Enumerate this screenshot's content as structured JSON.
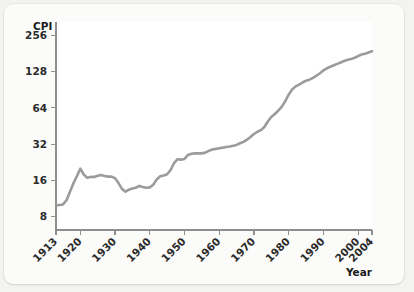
{
  "chart_data": {
    "type": "line",
    "title": "",
    "xlabel": "Year",
    "ylabel": "CPI",
    "yscale": "log2",
    "ylim": [
      6.2,
      330
    ],
    "xlim": [
      1913,
      2004
    ],
    "grid": false,
    "legend": null,
    "line_color": "#9b9b9b",
    "axis_color": "#8e8e8e",
    "plot_background": "#ffffff",
    "card_background": "#fbfbfa",
    "page_background": "#f3f3f1",
    "ytick_labels": [
      "256",
      "128",
      "64",
      "32",
      "16",
      "8"
    ],
    "ytick_values": [
      256,
      128,
      64,
      32,
      16,
      8
    ],
    "xtick_labels": [
      "1913",
      "1920",
      "1930",
      "1940",
      "1950",
      "1960",
      "1970",
      "1980",
      "1990",
      "2000",
      "2004"
    ],
    "xtick_values": [
      1913,
      1920,
      1930,
      1940,
      1950,
      1960,
      1970,
      1980,
      1990,
      2000,
      2004
    ],
    "x": [
      1913,
      1914,
      1915,
      1916,
      1917,
      1918,
      1919,
      1920,
      1921,
      1922,
      1923,
      1924,
      1925,
      1926,
      1927,
      1928,
      1929,
      1930,
      1931,
      1932,
      1933,
      1934,
      1935,
      1936,
      1937,
      1938,
      1939,
      1940,
      1941,
      1942,
      1943,
      1944,
      1945,
      1946,
      1947,
      1948,
      1949,
      1950,
      1951,
      1952,
      1953,
      1954,
      1955,
      1956,
      1957,
      1958,
      1959,
      1960,
      1961,
      1962,
      1963,
      1964,
      1965,
      1966,
      1967,
      1968,
      1969,
      1970,
      1971,
      1972,
      1973,
      1974,
      1975,
      1976,
      1977,
      1978,
      1979,
      1980,
      1981,
      1982,
      1983,
      1984,
      1985,
      1986,
      1987,
      1988,
      1989,
      1990,
      1991,
      1992,
      1993,
      1994,
      1995,
      1996,
      1997,
      1998,
      1999,
      2000,
      2001,
      2002,
      2003,
      2004
    ],
    "values": [
      9.9,
      10.0,
      10.1,
      10.9,
      12.8,
      15.1,
      17.3,
      20.0,
      17.9,
      16.8,
      17.1,
      17.1,
      17.5,
      17.7,
      17.4,
      17.2,
      17.2,
      16.7,
      15.2,
      13.6,
      12.9,
      13.4,
      13.7,
      13.9,
      14.4,
      14.1,
      13.9,
      14.0,
      14.7,
      16.3,
      17.3,
      17.6,
      18.0,
      19.5,
      22.3,
      24.0,
      23.8,
      24.1,
      26.0,
      26.6,
      26.8,
      26.9,
      26.8,
      27.2,
      28.1,
      28.9,
      29.2,
      29.6,
      29.9,
      30.3,
      30.6,
      31.0,
      31.5,
      32.5,
      33.4,
      34.8,
      36.7,
      38.8,
      40.5,
      41.8,
      44.4,
      49.3,
      53.8,
      56.9,
      60.6,
      65.2,
      72.6,
      82.4,
      90.9,
      96.5,
      99.6,
      103.9,
      107.6,
      109.6,
      113.6,
      118.3,
      124.0,
      130.7,
      136.2,
      140.3,
      144.5,
      148.2,
      152.4,
      156.9,
      160.5,
      163.0,
      166.6,
      172.2,
      177.1,
      179.9,
      184.0,
      188.9
    ],
    "annotations": []
  },
  "axis_titles": {
    "y": "CPI",
    "x": "Year"
  }
}
